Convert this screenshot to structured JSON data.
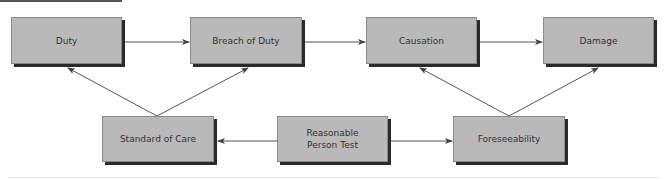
{
  "diagram": {
    "nodes": [
      {
        "id": "duty",
        "label": "Duty",
        "x": 11,
        "y": 17,
        "w": 111,
        "h": 47
      },
      {
        "id": "breach",
        "label": "Breach of Duty",
        "x": 190,
        "y": 17,
        "w": 112,
        "h": 47
      },
      {
        "id": "causation",
        "label": "Causation",
        "x": 366,
        "y": 17,
        "w": 111,
        "h": 47
      },
      {
        "id": "damage",
        "label": "Damage",
        "x": 543,
        "y": 17,
        "w": 111,
        "h": 47
      },
      {
        "id": "standard",
        "label": "Standard of Care",
        "x": 102,
        "y": 116,
        "w": 112,
        "h": 46
      },
      {
        "id": "reasonable",
        "label": "Reasonable\nPerson Test",
        "x": 277,
        "y": 116,
        "w": 111,
        "h": 46
      },
      {
        "id": "foreseeability",
        "label": "Foreseeability",
        "x": 453,
        "y": 116,
        "w": 112,
        "h": 46
      }
    ],
    "edges": [
      {
        "from": "duty",
        "to": "breach"
      },
      {
        "from": "breach",
        "to": "causation"
      },
      {
        "from": "causation",
        "to": "damage"
      },
      {
        "from": "standard",
        "to": "duty"
      },
      {
        "from": "standard",
        "to": "breach"
      },
      {
        "from": "foreseeability",
        "to": "causation"
      },
      {
        "from": "foreseeability",
        "to": "damage"
      },
      {
        "from": "reasonable",
        "to": "standard"
      },
      {
        "from": "reasonable",
        "to": "foreseeability"
      }
    ],
    "colors": {
      "node_fill": "#b9b9b9",
      "node_border": "#8a8a8a",
      "node_shadow": "#2a2a2a",
      "text": "#333333",
      "arrow": "#555555"
    }
  }
}
